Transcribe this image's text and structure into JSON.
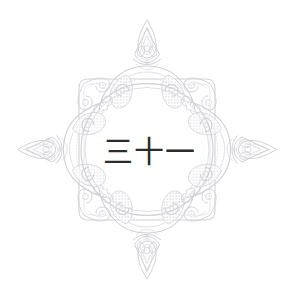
{
  "artwork": {
    "title": "Ornamental damask medallion",
    "background_color": "#ffffff",
    "center_numeral": "三十一",
    "center_numeral_romanized": "san-juu-ichi",
    "center_numeral_value": "31",
    "ink_color": "#2b2b2b",
    "ornament_color": "#d6d6da",
    "ornament_color_dark": "#c4c4ca",
    "ornament_color_light": "#e6e6ea",
    "ring_color": "#cfcfd4"
  },
  "frame": {
    "shape": "rounded-square",
    "finials": [
      {
        "position": "top",
        "name": "flame-finial"
      },
      {
        "position": "right",
        "name": "lance-finial"
      },
      {
        "position": "bottom",
        "name": "flame-finial"
      },
      {
        "position": "left",
        "name": "lance-finial"
      }
    ],
    "corner_scrolls": 4,
    "rings": 2
  },
  "canvas": {
    "width": "294",
    "height": "299"
  }
}
